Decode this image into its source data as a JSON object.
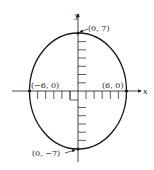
{
  "diagram": {
    "type": "ellipse-graph",
    "equation_implied": "x^2/36 + y^2/49 = 1",
    "axes": {
      "x_label": "x",
      "y_label": "y"
    },
    "points": [
      {
        "label": "(0, 7)",
        "x": 0,
        "y": 7
      },
      {
        "label": "(−6, 0)",
        "x": -6,
        "y": 0
      },
      {
        "label": "(6, 0)",
        "x": 6,
        "y": 0
      },
      {
        "label": "(0, −7)",
        "x": 0,
        "y": -7
      }
    ],
    "ellipse": {
      "semi_major_y": 7,
      "semi_minor_x": 6
    },
    "colors": {
      "stroke": "#1a1a1a",
      "background": "#ffffff"
    }
  }
}
